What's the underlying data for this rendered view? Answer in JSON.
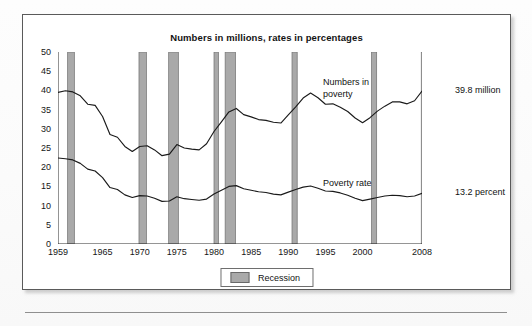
{
  "figure": {
    "title": "Numbers in millions, rates in percentages",
    "legend": {
      "label": "Recession",
      "swatch_name": "recession-swatch",
      "swatch_color": "#a9a9a9"
    },
    "annotations": {
      "series1_label": "Numbers in\npoverty",
      "series2_label": "Poverty rate",
      "series1_endpoint": "39.8 million",
      "series2_endpoint": "13.2 percent"
    }
  },
  "chart_data": {
    "type": "line",
    "title": "Numbers in millions, rates in percentages",
    "xlabel": "",
    "ylabel": "",
    "xlim": [
      1959,
      2008
    ],
    "ylim": [
      0,
      50
    ],
    "grid": false,
    "legend_position": "bottom-center",
    "y_ticks": [
      0,
      5,
      10,
      15,
      20,
      25,
      30,
      35,
      40,
      45,
      50
    ],
    "x_ticks": [
      1959,
      1965,
      1970,
      1975,
      1980,
      1985,
      1990,
      1995,
      2000,
      2008
    ],
    "x_minor_tick_interval": 1,
    "line_color": "#1a1a1a",
    "x": [
      1959,
      1960,
      1961,
      1962,
      1963,
      1964,
      1965,
      1966,
      1967,
      1968,
      1969,
      1970,
      1971,
      1972,
      1973,
      1974,
      1975,
      1976,
      1977,
      1978,
      1979,
      1980,
      1981,
      1982,
      1983,
      1984,
      1985,
      1986,
      1987,
      1988,
      1989,
      1990,
      1991,
      1992,
      1993,
      1994,
      1995,
      1996,
      1997,
      1998,
      1999,
      2000,
      2001,
      2002,
      2003,
      2004,
      2005,
      2006,
      2007,
      2008
    ],
    "series": [
      {
        "name": "Numbers in poverty",
        "units": "millions",
        "end_label": "39.8 million",
        "values": [
          39.5,
          39.9,
          39.6,
          38.6,
          36.4,
          36.1,
          33.2,
          28.5,
          27.8,
          25.4,
          24.1,
          25.4,
          25.6,
          24.5,
          23.0,
          23.4,
          25.9,
          25.0,
          24.7,
          24.5,
          26.1,
          29.3,
          31.8,
          34.4,
          35.3,
          33.7,
          33.1,
          32.4,
          32.2,
          31.7,
          31.5,
          33.6,
          35.7,
          38.0,
          39.3,
          38.1,
          36.4,
          36.5,
          35.6,
          34.5,
          32.8,
          31.6,
          32.9,
          34.6,
          35.9,
          37.0,
          37.0,
          36.5,
          37.3,
          39.8
        ]
      },
      {
        "name": "Poverty rate",
        "units": "percent",
        "end_label": "13.2 percent",
        "values": [
          22.4,
          22.2,
          21.9,
          21.0,
          19.5,
          19.0,
          17.3,
          14.7,
          14.2,
          12.8,
          12.1,
          12.6,
          12.5,
          11.9,
          11.1,
          11.2,
          12.3,
          11.8,
          11.6,
          11.4,
          11.7,
          13.0,
          14.0,
          15.0,
          15.2,
          14.4,
          14.0,
          13.6,
          13.4,
          13.0,
          12.8,
          13.5,
          14.2,
          14.8,
          15.1,
          14.5,
          13.8,
          13.7,
          13.3,
          12.7,
          11.9,
          11.3,
          11.7,
          12.1,
          12.5,
          12.7,
          12.6,
          12.3,
          12.5,
          13.2
        ]
      }
    ],
    "recessions": [
      {
        "start": 1960.3,
        "end": 1961.2
      },
      {
        "start": 1969.9,
        "end": 1970.9
      },
      {
        "start": 1973.9,
        "end": 1975.2
      },
      {
        "start": 1980.0,
        "end": 1980.6
      },
      {
        "start": 1981.5,
        "end": 1982.9
      },
      {
        "start": 1990.5,
        "end": 1991.2
      },
      {
        "start": 2001.2,
        "end": 2001.9
      },
      {
        "start": 2007.9,
        "end": 2008.6
      }
    ]
  }
}
